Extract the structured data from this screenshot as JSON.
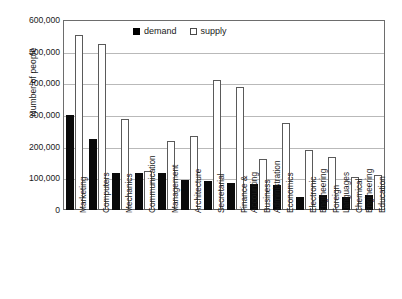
{
  "chart_data": {
    "type": "bar",
    "title": "",
    "xlabel": "",
    "ylabel": "Number of people",
    "ylim": [
      0,
      600000
    ],
    "ytick_labels": [
      "600,000",
      "500,000",
      "400,000",
      "300,000",
      "200,000",
      "100,000",
      "0"
    ],
    "ytick_values": [
      600000,
      500000,
      400000,
      300000,
      200000,
      100000,
      0
    ],
    "grid": true,
    "legend_position": "top-center",
    "categories": [
      "Marketing",
      "Computers",
      "Mechanics",
      "Communication",
      "Management",
      "Architecture",
      "Secretarial",
      "Finance & Accounting",
      "Business Administration",
      "Economics",
      "Electronic Engineering",
      "Foreign Languages",
      "Chemical Engineering",
      "Education"
    ],
    "category_lines": [
      [
        "Marketing",
        ""
      ],
      [
        "Computers",
        ""
      ],
      [
        "Mechanics",
        ""
      ],
      [
        "Communication",
        ""
      ],
      [
        "Management",
        ""
      ],
      [
        "Architecture",
        ""
      ],
      [
        "Secretarial",
        ""
      ],
      [
        "Finance &",
        "Accounting"
      ],
      [
        "Business",
        "Administration"
      ],
      [
        "Economics",
        ""
      ],
      [
        "Electronic",
        "Engineering"
      ],
      [
        "Foreign",
        "Languages"
      ],
      [
        "Chemical",
        "Engineering"
      ],
      [
        "Education",
        ""
      ]
    ],
    "series": [
      {
        "name": "demand",
        "color": "#000000",
        "values": [
          300000,
          225000,
          118000,
          118000,
          118000,
          95000,
          92000,
          85000,
          82000,
          78000,
          40000,
          48000,
          42000,
          48000
        ]
      },
      {
        "name": "supply",
        "color": "#ffffff",
        "values": [
          553000,
          525000,
          288000,
          122000,
          218000,
          235000,
          410000,
          390000,
          160000,
          275000,
          190000,
          168000,
          105000,
          110000
        ]
      }
    ]
  },
  "legend": {
    "items": [
      {
        "label": "demand"
      },
      {
        "label": "supply"
      }
    ]
  }
}
